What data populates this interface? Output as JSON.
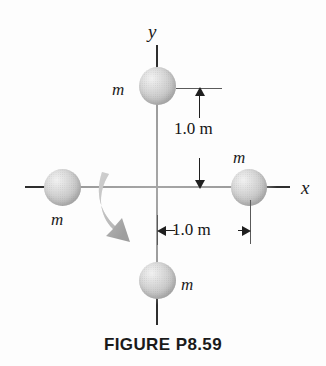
{
  "figure": {
    "caption": "FIGURE P8.59",
    "background_color": "#fdfdfd",
    "axes": {
      "x_label": "x",
      "y_label": "y",
      "axis_color": "#8d8d8d",
      "origin": {
        "x": 157,
        "y": 187
      }
    },
    "masses": [
      {
        "id": "top",
        "label": "m",
        "position": "on positive y-axis, 1.0 m above origin"
      },
      {
        "id": "left",
        "label": "m",
        "position": "on negative x-axis, 1.0 m left of origin"
      },
      {
        "id": "right",
        "label": "m",
        "position": "on positive x-axis, 1.0 m right of origin"
      },
      {
        "id": "bottom",
        "label": "m",
        "position": "on negative y-axis, 1.0 m below origin"
      }
    ],
    "dimensions": [
      {
        "id": "vertical",
        "value": "1.0 m",
        "orientation": "vertical",
        "describes": "distance from origin to top mass"
      },
      {
        "id": "horizontal",
        "value": "1.0 m",
        "orientation": "horizontal",
        "describes": "distance from origin to right mass"
      }
    ],
    "rotation_arrow": {
      "name": "rotation-direction-arrow",
      "description": "curved gray arrow sweeping clockwise from the negative x-axis downward",
      "color": "#a9a9a9"
    }
  }
}
